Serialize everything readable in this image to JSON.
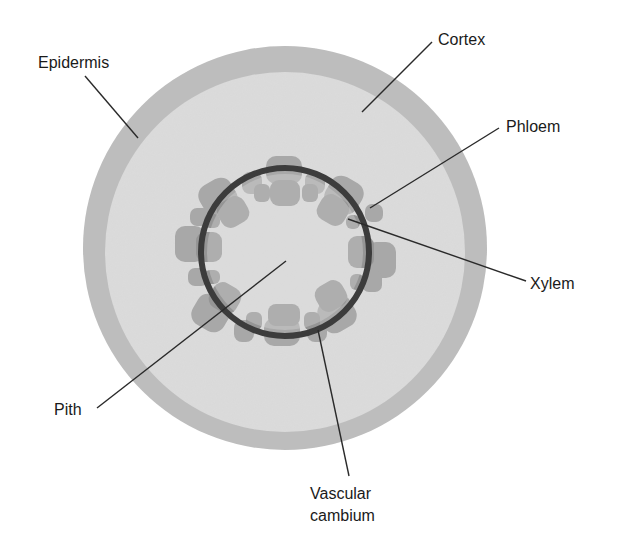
{
  "colors": {
    "background": "#ffffff",
    "epidermis": "#bdbdbd",
    "cortex": "#dcdcdc",
    "phloem": "#a9a9a9",
    "xylem": "#8f8f8f",
    "vascular_cambium": "#3c3c3c",
    "pith": "#dedede",
    "leader_line": "#2a2a2a",
    "text": "#1a1a1a"
  },
  "geometry": {
    "center": [
      285,
      250
    ],
    "epidermis_radius": 202,
    "cortex_radius": 180,
    "cambium_radius": 85
  },
  "labels": {
    "epidermis": "Epidermis",
    "cortex": "Cortex",
    "phloem": "Phloem",
    "xylem": "Xylem",
    "pith": "Pith",
    "vascular_cambium_line1": "Vascular",
    "vascular_cambium_line2": "cambium"
  }
}
